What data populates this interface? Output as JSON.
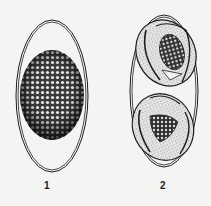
{
  "figure": {
    "panels": [
      {
        "label": "1",
        "description": "oval egg with double-line shell containing a granular (morula-like) spherical mass"
      },
      {
        "label": "2",
        "description": "oval egg with double-line shell containing two folded embryos/larvae with granular centers"
      }
    ]
  },
  "colors": {
    "background": "#f4f4f2",
    "ink": "#1e1e1e",
    "stipple": "#555555"
  }
}
